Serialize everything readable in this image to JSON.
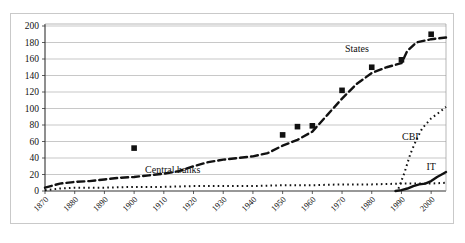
{
  "chart_data": {
    "type": "line",
    "title": "",
    "subtitle": "",
    "xlabel": "",
    "ylabel": "",
    "xlim": [
      1870,
      2005
    ],
    "ylim": [
      0,
      200
    ],
    "ytick_step": 20,
    "grid": true,
    "grid_axis": "y",
    "legend": "inline-annotations",
    "legend_position": "inline",
    "yticks": [
      "0",
      "20",
      "40",
      "60",
      "80",
      "100",
      "120",
      "140",
      "160",
      "180",
      "200"
    ],
    "xticks": [
      "1870",
      "1880",
      "1890",
      "1900",
      "1910",
      "1920",
      "1930",
      "1940",
      "1950",
      "1960",
      "1970",
      "1980",
      "1990",
      "2000"
    ],
    "annotations": [
      {
        "name": "states",
        "label": "States",
        "x": 1975,
        "y": 168
      },
      {
        "name": "central-banks",
        "label": "Central banks",
        "x": 1913,
        "y": 22
      },
      {
        "name": "cbi",
        "label": "CBI",
        "x": 1993,
        "y": 62
      },
      {
        "name": "it",
        "label": "IT",
        "x": 2000,
        "y": 25
      }
    ],
    "series": [
      {
        "name": "States",
        "style": "dashed",
        "color": "#111111",
        "marker": "square",
        "points": [
          {
            "x": 1870,
            "y": 4
          },
          {
            "x": 1875,
            "y": 9
          },
          {
            "x": 1880,
            "y": 11
          },
          {
            "x": 1885,
            "y": 12
          },
          {
            "x": 1890,
            "y": 14
          },
          {
            "x": 1895,
            "y": 16
          },
          {
            "x": 1900,
            "y": 17
          },
          {
            "x": 1905,
            "y": 19
          },
          {
            "x": 1910,
            "y": 21
          },
          {
            "x": 1915,
            "y": 24
          },
          {
            "x": 1920,
            "y": 30
          },
          {
            "x": 1925,
            "y": 35
          },
          {
            "x": 1930,
            "y": 38
          },
          {
            "x": 1935,
            "y": 40
          },
          {
            "x": 1940,
            "y": 42
          },
          {
            "x": 1945,
            "y": 46
          },
          {
            "x": 1950,
            "y": 55
          },
          {
            "x": 1955,
            "y": 62
          },
          {
            "x": 1960,
            "y": 72
          },
          {
            "x": 1965,
            "y": 92
          },
          {
            "x": 1970,
            "y": 112
          },
          {
            "x": 1975,
            "y": 130
          },
          {
            "x": 1980,
            "y": 143
          },
          {
            "x": 1985,
            "y": 150
          },
          {
            "x": 1990,
            "y": 155
          },
          {
            "x": 1992,
            "y": 170
          },
          {
            "x": 1995,
            "y": 180
          },
          {
            "x": 2000,
            "y": 184
          },
          {
            "x": 2005,
            "y": 186
          }
        ],
        "markers": [
          {
            "x": 1900,
            "y": 52
          },
          {
            "x": 1950,
            "y": 68
          },
          {
            "x": 1955,
            "y": 78
          },
          {
            "x": 1960,
            "y": 79
          },
          {
            "x": 1970,
            "y": 122
          },
          {
            "x": 1980,
            "y": 150
          },
          {
            "x": 1990,
            "y": 159
          },
          {
            "x": 2000,
            "y": 190
          }
        ]
      },
      {
        "name": "Central banks",
        "style": "dotted",
        "color": "#111111",
        "marker": "none",
        "points": [
          {
            "x": 1870,
            "y": 1
          },
          {
            "x": 1875,
            "y": 3
          },
          {
            "x": 1880,
            "y": 4
          },
          {
            "x": 1890,
            "y": 4
          },
          {
            "x": 1900,
            "y": 5
          },
          {
            "x": 1910,
            "y": 5
          },
          {
            "x": 1920,
            "y": 6
          },
          {
            "x": 1930,
            "y": 6
          },
          {
            "x": 1940,
            "y": 6
          },
          {
            "x": 1950,
            "y": 7
          },
          {
            "x": 1960,
            "y": 7
          },
          {
            "x": 1970,
            "y": 8
          },
          {
            "x": 1980,
            "y": 8
          },
          {
            "x": 1990,
            "y": 9
          },
          {
            "x": 2000,
            "y": 9
          },
          {
            "x": 2005,
            "y": 10
          }
        ]
      },
      {
        "name": "CBI",
        "style": "dotted",
        "color": "#111111",
        "marker": "none",
        "points": [
          {
            "x": 1989,
            "y": 3
          },
          {
            "x": 1991,
            "y": 22
          },
          {
            "x": 1993,
            "y": 45
          },
          {
            "x": 1995,
            "y": 62
          },
          {
            "x": 1997,
            "y": 76
          },
          {
            "x": 2000,
            "y": 88
          },
          {
            "x": 2003,
            "y": 96
          },
          {
            "x": 2005,
            "y": 102
          }
        ]
      },
      {
        "name": "IT",
        "style": "solid",
        "color": "#111111",
        "marker": "none",
        "points": [
          {
            "x": 1988,
            "y": 0
          },
          {
            "x": 1990,
            "y": 1
          },
          {
            "x": 1992,
            "y": 3
          },
          {
            "x": 1994,
            "y": 6
          },
          {
            "x": 1996,
            "y": 8
          },
          {
            "x": 1998,
            "y": 9
          },
          {
            "x": 2000,
            "y": 12
          },
          {
            "x": 2002,
            "y": 17
          },
          {
            "x": 2004,
            "y": 21
          },
          {
            "x": 2005,
            "y": 23
          }
        ]
      }
    ]
  }
}
